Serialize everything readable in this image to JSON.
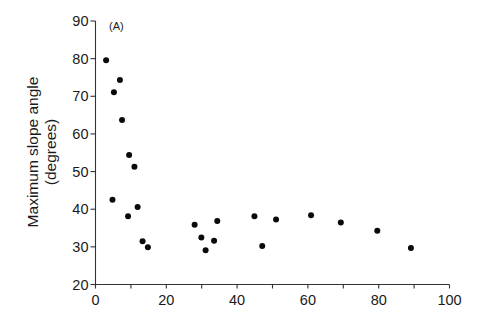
{
  "chart_data": {
    "type": "scatter",
    "title": "",
    "panel_label": "(A)",
    "xlabel": "",
    "ylabel_lines": [
      "Maximum slope angle",
      "(degrees)"
    ],
    "xlim": [
      0,
      100
    ],
    "ylim": [
      20,
      90
    ],
    "x_ticks": [
      0,
      20,
      40,
      60,
      80,
      100
    ],
    "x_minor_ticks": [
      10,
      30,
      50,
      70,
      90
    ],
    "y_ticks": [
      20,
      30,
      40,
      50,
      60,
      70,
      80,
      90
    ],
    "grid": false,
    "legend": null,
    "series": [
      {
        "name": "data",
        "color": "#0a0a0a",
        "points": [
          {
            "x": 3.0,
            "y": 79.6
          },
          {
            "x": 6.9,
            "y": 74.3
          },
          {
            "x": 5.2,
            "y": 71.1
          },
          {
            "x": 7.5,
            "y": 63.7
          },
          {
            "x": 9.5,
            "y": 54.4
          },
          {
            "x": 11.0,
            "y": 51.3
          },
          {
            "x": 4.8,
            "y": 42.5
          },
          {
            "x": 11.9,
            "y": 40.6
          },
          {
            "x": 9.2,
            "y": 38.1
          },
          {
            "x": 13.3,
            "y": 31.5
          },
          {
            "x": 14.8,
            "y": 29.9
          },
          {
            "x": 28.0,
            "y": 35.9
          },
          {
            "x": 34.4,
            "y": 36.9
          },
          {
            "x": 29.9,
            "y": 32.5
          },
          {
            "x": 33.5,
            "y": 31.6
          },
          {
            "x": 31.1,
            "y": 29.1
          },
          {
            "x": 44.9,
            "y": 38.1
          },
          {
            "x": 47.1,
            "y": 30.2
          },
          {
            "x": 51.0,
            "y": 37.3
          },
          {
            "x": 60.9,
            "y": 38.4
          },
          {
            "x": 69.3,
            "y": 36.5
          },
          {
            "x": 79.6,
            "y": 34.3
          },
          {
            "x": 89.1,
            "y": 29.7
          }
        ]
      }
    ]
  }
}
